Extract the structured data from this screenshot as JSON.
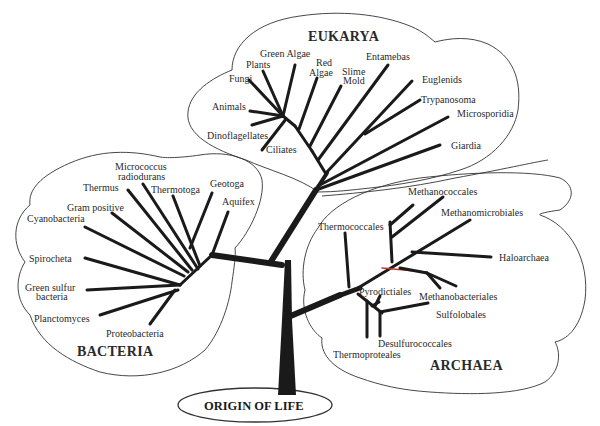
{
  "diagram": {
    "type": "phylogenetic-tree",
    "root_label": "ORIGIN OF LIFE",
    "ink_color": "#1a1a1a",
    "accent_color": "#c0392b",
    "domains": [
      {
        "name": "EUKARYA",
        "taxa": [
          "Green Algae",
          "Plants",
          "Fungi",
          "Red",
          "Algae",
          "Slime",
          "Mold",
          "Animals",
          "Dinoflagellates",
          "Ciliates",
          "Entamebas",
          "Euglenids",
          "Trypanosoma",
          "Microsporidia",
          "Giardia"
        ]
      },
      {
        "name": "BACTERIA",
        "taxa": [
          "Micrococcus",
          "radiodurans",
          "Thermus",
          "Thermotoga",
          "Geotoga",
          "Aquifex",
          "Gram positive",
          "Cyanobacteria",
          "Spirocheta",
          "Green sulfur",
          "bacteria",
          "Planctomyces",
          "Proteobacteria"
        ]
      },
      {
        "name": "ARCHAEA",
        "taxa": [
          "Methanococcales",
          "Methanomicrobiales",
          "Thermococcales",
          "Haloarchaea",
          "Pyrodictiales",
          "Methanobacteriales",
          "Sulfolobales",
          "Desulfurococcales",
          "Thermoproteales"
        ]
      }
    ]
  }
}
